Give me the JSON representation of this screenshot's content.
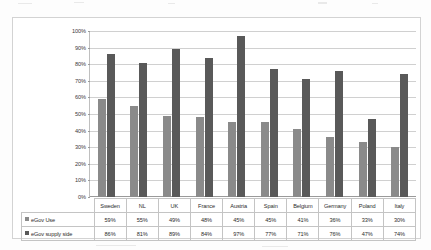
{
  "chart_data": {
    "type": "bar",
    "title": "",
    "subtitle": "",
    "xlabel": "",
    "ylabel": "",
    "ylim": [
      0,
      100
    ],
    "ytick_labels": [
      "100%",
      "90%",
      "80%",
      "70%",
      "60%",
      "50%",
      "40%",
      "30%",
      "20%",
      "10%",
      "0%"
    ],
    "grid": "horizontal",
    "legend_position": "data-table-row-labels",
    "categories": [
      "Sweden",
      "NL",
      "UK",
      "France",
      "Austria",
      "Spain",
      "Belgium",
      "Germany",
      "Poland",
      "Italy"
    ],
    "series": [
      {
        "name": "eGov Use",
        "color": "#8a8a8a",
        "values": [
          59,
          55,
          49,
          48,
          45,
          45,
          41,
          36,
          33,
          30
        ],
        "labels": [
          "59%",
          "55%",
          "49%",
          "48%",
          "45%",
          "45%",
          "41%",
          "36%",
          "33%",
          "30%"
        ]
      },
      {
        "name": "eGov supply side",
        "color": "#595959",
        "values": [
          86,
          81,
          89,
          84,
          97,
          77,
          71,
          76,
          47,
          74
        ],
        "labels": [
          "86%",
          "81%",
          "89%",
          "84%",
          "97%",
          "77%",
          "71%",
          "76%",
          "47%",
          "74%"
        ]
      }
    ]
  }
}
